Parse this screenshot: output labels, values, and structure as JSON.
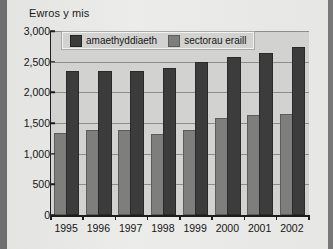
{
  "chart_data": {
    "type": "bar",
    "title": "Ewros y mis",
    "xlabel": "",
    "ylabel": "Ewros y mis",
    "categories": [
      "1995",
      "1996",
      "1997",
      "1998",
      "1999",
      "2000",
      "2001",
      "2002"
    ],
    "series": [
      {
        "name": "amaethyddiaeth",
        "color": "#3c3c3c",
        "values": [
          1300,
          1360,
          1355,
          1290,
          1355,
          1550,
          1595,
          1610
        ]
      },
      {
        "name": "sectorau eraill",
        "color": "#7e7e7c",
        "values": [
          2320,
          2320,
          2315,
          2370,
          2455,
          2540,
          2610,
          2705
        ]
      }
    ],
    "ylim": [
      0,
      3000
    ],
    "ytick_values": [
      0,
      500,
      1000,
      1500,
      2000,
      2500,
      3000
    ],
    "ytick_labels": [
      "0",
      "500",
      "1,000",
      "1,500",
      "2,000",
      "2,500",
      "3,000"
    ],
    "grid": true,
    "legend_position": "top-left-inside"
  },
  "legend": {
    "entries": [
      {
        "label": "amaethyddiaeth"
      },
      {
        "label": "sectorau eraill"
      }
    ]
  },
  "colors": {
    "series_dark": "#3c3c3c",
    "series_light": "#7e7e7c",
    "plot_background": "#d2d2d0",
    "page_background": "#e9e9e7",
    "axis": "#1c1c1c",
    "gridline": "#8d8d8b"
  }
}
